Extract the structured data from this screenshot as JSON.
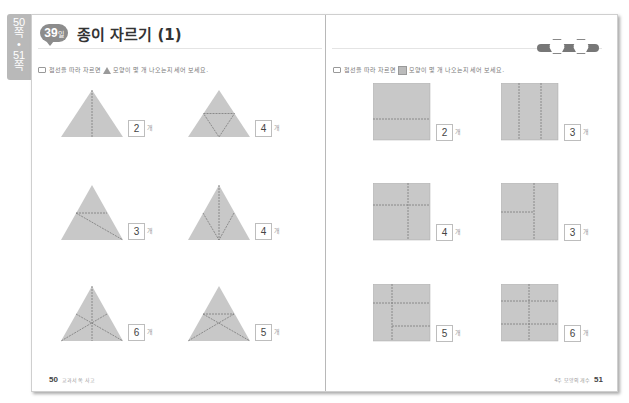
{
  "side_tab": {
    "lines": [
      "50",
      "쪽",
      "•",
      "51",
      "쪽"
    ]
  },
  "header": {
    "day_badge": "39",
    "day_suffix": "일",
    "title": "종이 자르기 (1)",
    "progress_hexes": [
      "월",
      "일"
    ]
  },
  "left_page": {
    "instruction_prefix": "점선을 따라 자르면",
    "instruction_shape": "triangle-icon",
    "instruction_suffix": "모양이 몇 개 나오는지 세어 보세요.",
    "items": [
      {
        "answer": "2",
        "unit": "개"
      },
      {
        "answer": "4",
        "unit": "개"
      },
      {
        "answer": "3",
        "unit": "개"
      },
      {
        "answer": "4",
        "unit": "개"
      },
      {
        "answer": "6",
        "unit": "개"
      },
      {
        "answer": "5",
        "unit": "개"
      }
    ],
    "page_number": "50",
    "footer_label": "교과서 쏙 사고"
  },
  "right_page": {
    "instruction_prefix": "점선을 따라 자르면",
    "instruction_shape": "square-icon",
    "instruction_suffix": "모양이 몇 개 나오는지 세어 보세요.",
    "items": [
      {
        "answer": "2",
        "unit": "개"
      },
      {
        "answer": "3",
        "unit": "개"
      },
      {
        "answer": "4",
        "unit": "개"
      },
      {
        "answer": "3",
        "unit": "개"
      },
      {
        "answer": "5",
        "unit": "개"
      },
      {
        "answer": "6",
        "unit": "개"
      }
    ],
    "page_number": "51",
    "footer_label": "4주 모양의 개수"
  },
  "colors": {
    "shape_fill": "#c8c8c8",
    "shape_line": "#7a7a7a",
    "badge": "#8c8c8c"
  }
}
